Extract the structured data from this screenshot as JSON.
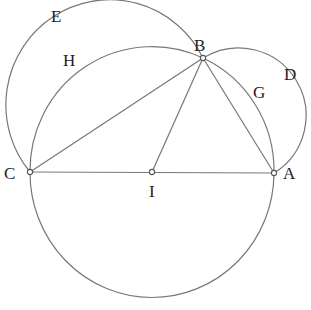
{
  "diagram": {
    "type": "geometric-construction",
    "points": {
      "A": {
        "label": "A",
        "x": 274,
        "y": 173
      },
      "B": {
        "label": "B",
        "x": 203,
        "y": 58
      },
      "C": {
        "label": "C",
        "x": 30,
        "y": 172
      },
      "I": {
        "label": "I",
        "x": 152,
        "y": 172
      }
    },
    "arc_labels": {
      "D": {
        "label": "D"
      },
      "E": {
        "label": "E"
      },
      "G": {
        "label": "G"
      },
      "H": {
        "label": "H"
      }
    },
    "segments": [
      "CA",
      "CB",
      "BA",
      "IB"
    ],
    "circles": [
      {
        "name": "circle-CBA",
        "center": "I",
        "radius": 122
      },
      {
        "name": "arc-E",
        "through": [
          "C",
          "B"
        ]
      },
      {
        "name": "arc-D",
        "through": [
          "B",
          "A"
        ]
      }
    ]
  }
}
